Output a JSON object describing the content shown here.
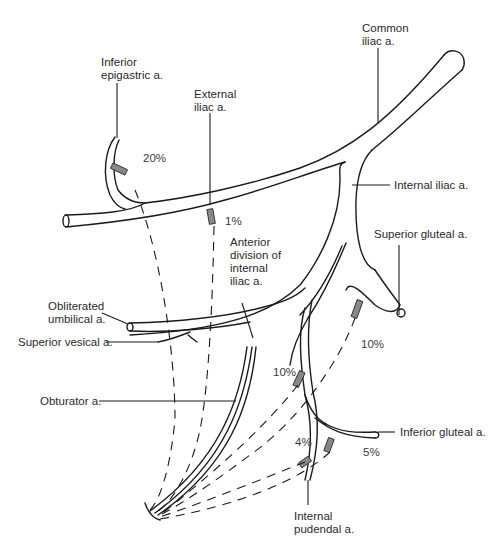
{
  "diagram": {
    "type": "anatomical-illustration",
    "labels": {
      "inferior_epigastric": "Inferior\nepigastric a.",
      "external_iliac": "External\niliac a.",
      "common_iliac": "Common\niliac a.",
      "internal_iliac": "Internal iliac a.",
      "superior_gluteal": "Superior gluteal a.",
      "anterior_division": "Anterior\ndivision of\ninternal\niliac a.",
      "obliterated_umbilical": "Obliterated\numbilical a.",
      "superior_vesical": "Superior vesical a.",
      "obturator": "Obturator a.",
      "inferior_gluteal": "Inferior gluteal a.",
      "internal_pudendal": "Internal\npudendal a."
    },
    "percentages": {
      "inferior_epigastric": "20%",
      "external_iliac": "1%",
      "superior_gluteal": "10%",
      "anterior_division": "10%",
      "internal_pudendal": "4%",
      "inferior_gluteal": "5%"
    },
    "colors": {
      "line": "#1a1a1a",
      "text": "#2a2a2a",
      "background": "#ffffff",
      "stump_fill": "#888888"
    }
  }
}
